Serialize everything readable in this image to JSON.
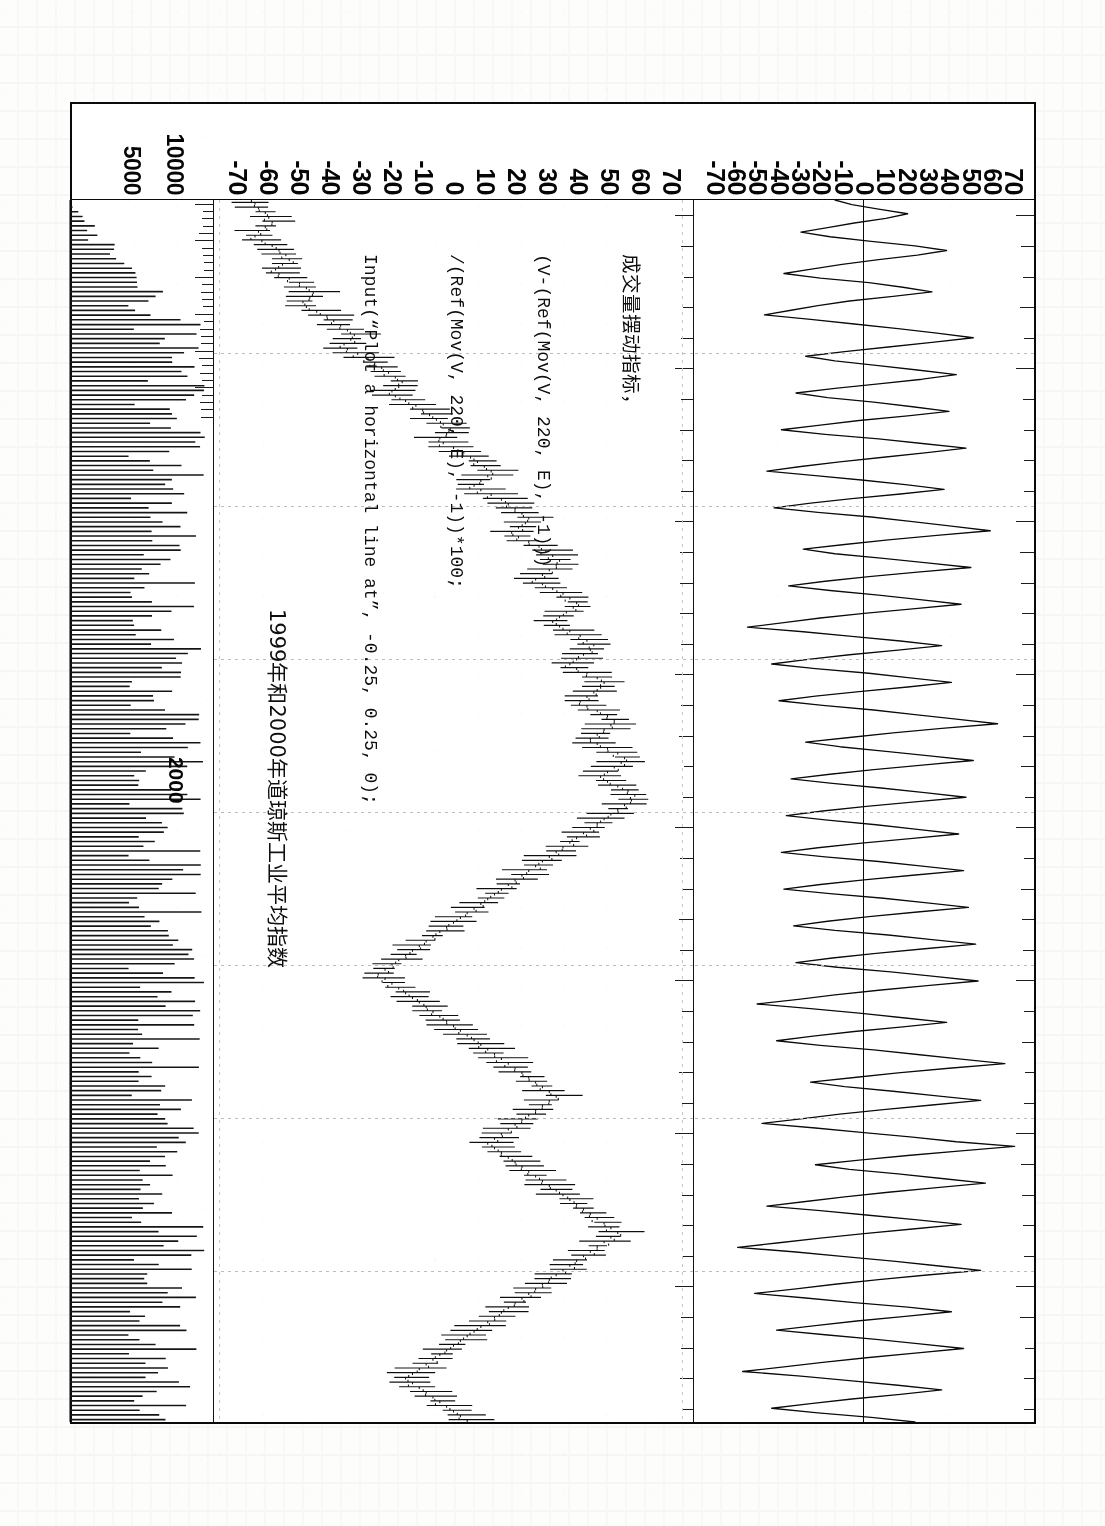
{
  "document": {
    "type": "scanned-book-page",
    "orientation": "figure rotated 90 degrees counter-clockwise"
  },
  "figure": {
    "caption": "1999年和2000年道琼斯工业平均指数",
    "year_marker": "2000",
    "formula_block": {
      "title": "成交量摆动指标，",
      "lines": [
        "(V-(Ref(Mov(V, 220, E), -1)))",
        "/(Ref(Mov(V, 220, E), -1))*100;",
        "Input(“Plot a horizontal line at”, -0.25, 0.25, 0);"
      ]
    }
  },
  "axes": {
    "oscillator_top": {
      "label": "成交量摆动指标",
      "ticks": [
        "70",
        "60",
        "50",
        "40",
        "30",
        "20",
        "10",
        "0",
        "-10",
        "-20",
        "-30",
        "-40",
        "-50",
        "-60",
        "-70"
      ]
    },
    "oscillator_bottom": {
      "ticks": [
        "70",
        "60",
        "50",
        "40",
        "30",
        "20",
        "10",
        "0",
        "-10",
        "-20",
        "-30",
        "-40",
        "-50",
        "-60",
        "-70"
      ]
    },
    "volume": {
      "ticks": [
        "10000",
        "5000"
      ]
    }
  },
  "chart_data": {
    "type": "line",
    "title": "1999年和2000年道琼斯工业平均指数",
    "xlabel": "",
    "ylabel": "",
    "grid": true,
    "legend": null,
    "panels": [
      {
        "name": "volume-oscillator-upper",
        "type": "line",
        "ylim": [
          -70,
          70
        ],
        "yticks": [
          70,
          60,
          50,
          40,
          30,
          20,
          10,
          0,
          -10,
          -20,
          -30,
          -40,
          -50,
          -60,
          -70
        ],
        "zero_line": 0,
        "values": [
          -12,
          -5,
          6,
          18,
          9,
          -4,
          -15,
          -26,
          -14,
          3,
          21,
          34,
          22,
          6,
          -9,
          -21,
          -33,
          -18,
          2,
          16,
          28,
          12,
          -6,
          -19,
          -30,
          -41,
          -22,
          -4,
          14,
          30,
          45,
          28,
          10,
          -8,
          -24,
          -12,
          5,
          22,
          38,
          24,
          6,
          -12,
          -28,
          -15,
          4,
          20,
          35,
          18,
          -2,
          -18,
          -34,
          -16,
          6,
          24,
          42,
          26,
          8,
          -10,
          -26,
          -40,
          -20,
          0,
          18,
          33,
          15,
          -5,
          -22,
          -37,
          -19,
          3,
          20,
          36,
          52,
          30,
          10,
          -8,
          -25,
          -12,
          8,
          26,
          44,
          22,
          2,
          -16,
          -31,
          -14,
          6,
          23,
          40,
          20,
          0,
          -18,
          -33,
          -48,
          -25,
          -5,
          15,
          32,
          14,
          -6,
          -23,
          -38,
          -20,
          2,
          19,
          36,
          18,
          -2,
          -20,
          -35,
          -17,
          4,
          21,
          38,
          55,
          32,
          12,
          -6,
          -24,
          -10,
          9,
          27,
          45,
          24,
          4,
          -14,
          -30,
          -13,
          7,
          25,
          42,
          21,
          1,
          -17,
          -32,
          -15,
          5,
          22,
          39,
          19,
          -1,
          -19,
          -34,
          -16,
          6,
          24,
          41,
          20,
          0,
          -18,
          -33,
          -14,
          8,
          26,
          43,
          22,
          2,
          -15,
          -29,
          -12,
          10,
          28,
          46,
          25,
          5,
          -13,
          -28,
          -11,
          11,
          29,
          47,
          26,
          6,
          -12,
          -27,
          -44,
          -22,
          -2,
          16,
          34,
          16,
          -4,
          -21,
          -36,
          -18,
          4,
          22,
          40,
          58,
          35,
          14,
          -4,
          -22,
          -8,
          12,
          30,
          48,
          28,
          8,
          -10,
          -26,
          -42,
          -20,
          0,
          20,
          38,
          62,
          40,
          18,
          -2,
          -20,
          -6,
          14,
          32,
          50,
          30,
          10,
          -8,
          -24,
          -40,
          -18,
          2,
          22,
          40,
          20,
          0,
          -18,
          -35,
          -52,
          -28,
          -8,
          12,
          30,
          48,
          26,
          6,
          -12,
          -28,
          -45,
          -24,
          -4,
          18,
          36,
          17,
          -3,
          -20,
          -36,
          -16,
          5,
          23,
          41,
          21,
          1,
          -17,
          -33,
          -50,
          -26,
          -6,
          14,
          32,
          15,
          -5,
          -22,
          -38,
          -19,
          3,
          21
        ]
      },
      {
        "name": "dow-jones-ohlc",
        "type": "ohlc",
        "ylim": [
          -70,
          70
        ],
        "yticks": [
          70,
          60,
          50,
          40,
          30,
          20,
          10,
          0,
          -10,
          -20,
          -30,
          -40,
          -50,
          -60,
          -70
        ],
        "close": [
          -58,
          -57,
          -55,
          -54,
          -53,
          -55,
          -57,
          -58,
          -56,
          -53,
          -51,
          -49,
          -48,
          -50,
          -52,
          -51,
          -48,
          -45,
          -43,
          -41,
          -42,
          -44,
          -43,
          -40,
          -37,
          -35,
          -33,
          -31,
          -29,
          -30,
          -32,
          -31,
          -28,
          -25,
          -23,
          -21,
          -19,
          -17,
          -15,
          -16,
          -18,
          -17,
          -14,
          -11,
          -9,
          -7,
          -5,
          -3,
          -1,
          -2,
          -4,
          -3,
          0,
          3,
          5,
          7,
          9,
          11,
          10,
          8,
          6,
          8,
          11,
          14,
          16,
          18,
          20,
          22,
          21,
          19,
          17,
          19,
          22,
          25,
          27,
          29,
          31,
          30,
          28,
          26,
          24,
          26,
          29,
          32,
          34,
          36,
          35,
          33,
          31,
          29,
          31,
          34,
          37,
          39,
          41,
          40,
          38,
          36,
          34,
          36,
          39,
          42,
          44,
          43,
          41,
          39,
          37,
          39,
          42,
          45,
          47,
          46,
          44,
          42,
          40,
          42,
          45,
          48,
          50,
          49,
          47,
          45,
          43,
          45,
          48,
          51,
          53,
          52,
          50,
          48,
          46,
          44,
          42,
          40,
          38,
          36,
          34,
          32,
          30,
          28,
          26,
          24,
          22,
          20,
          18,
          16,
          14,
          12,
          10,
          8,
          6,
          4,
          2,
          0,
          -2,
          -4,
          -6,
          -8,
          -10,
          -12,
          -14,
          -16,
          -18,
          -20,
          -22,
          -20,
          -18,
          -16,
          -14,
          -12,
          -10,
          -8,
          -6,
          -4,
          -2,
          0,
          2,
          4,
          6,
          8,
          10,
          12,
          14,
          16,
          18,
          20,
          22,
          24,
          26,
          28,
          30,
          28,
          26,
          24,
          22,
          20,
          18,
          16,
          14,
          12,
          10,
          12,
          14,
          16,
          18,
          20,
          22,
          24,
          26,
          28,
          30,
          32,
          34,
          36,
          38,
          40,
          42,
          44,
          46,
          48,
          46,
          44,
          42,
          40,
          38,
          36,
          34,
          32,
          30,
          28,
          26,
          24,
          22,
          20,
          18,
          16,
          14,
          12,
          10,
          8,
          6,
          4,
          2,
          0,
          -2,
          -4,
          -6,
          -8,
          -10,
          -12,
          -14,
          -12,
          -10,
          -8,
          -6,
          -4,
          -2,
          0,
          2,
          4
        ]
      },
      {
        "name": "volume-histogram",
        "type": "bar",
        "ylim": [
          0,
          12000
        ],
        "yticks": [
          10000,
          5000
        ]
      }
    ]
  }
}
